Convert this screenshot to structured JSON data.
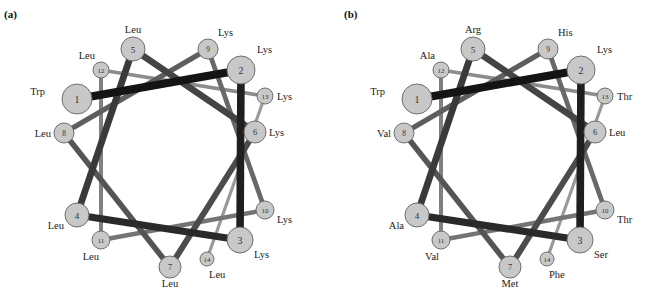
{
  "figure": {
    "type": "helical-wheel-diagram",
    "panels": [
      {
        "id": "a",
        "label": "(a)",
        "offset_x": 0,
        "residues": [
          "Trp",
          "Lys",
          "Lys",
          "Leu",
          "Leu",
          "Lys",
          "Leu",
          "Leu",
          "Lys",
          "Lys",
          "Leu",
          "Leu",
          "Lys",
          "Leu"
        ]
      },
      {
        "id": "b",
        "label": "(b)",
        "offset_x": 340,
        "residues": [
          "Trp",
          "Lys",
          "Ser",
          "Ala",
          "Arg",
          "Leu",
          "Met",
          "Val",
          "His",
          "Thr",
          "Val",
          "Ala",
          "Thr",
          "Phe"
        ]
      }
    ],
    "nodes": [
      {
        "n": 1,
        "x": 77,
        "y": 99,
        "r": 15,
        "label_dx": -32,
        "label_dy": -4,
        "anchor": "end"
      },
      {
        "n": 2,
        "x": 241,
        "y": 70,
        "r": 14,
        "label_dx": 16,
        "label_dy": -17,
        "anchor": "start"
      },
      {
        "n": 3,
        "x": 240,
        "y": 240,
        "r": 13,
        "label_dx": 14,
        "label_dy": 18,
        "anchor": "start"
      },
      {
        "n": 4,
        "x": 77,
        "y": 215,
        "r": 12,
        "label_dx": -13,
        "label_dy": 14,
        "anchor": "end"
      },
      {
        "n": 5,
        "x": 133,
        "y": 49,
        "r": 12,
        "label_dx": 0,
        "label_dy": -16,
        "anchor": "middle"
      },
      {
        "n": 6,
        "x": 255,
        "y": 132,
        "r": 11,
        "label_dx": 14,
        "label_dy": 4,
        "anchor": "start"
      },
      {
        "n": 7,
        "x": 170,
        "y": 267,
        "r": 11,
        "label_dx": 0,
        "label_dy": 20,
        "anchor": "middle"
      },
      {
        "n": 8,
        "x": 64,
        "y": 133,
        "r": 10,
        "label_dx": -13,
        "label_dy": 4,
        "anchor": "end"
      },
      {
        "n": 9,
        "x": 208,
        "y": 49,
        "r": 10,
        "label_dx": 10,
        "label_dy": -13,
        "anchor": "start"
      },
      {
        "n": 10,
        "x": 265,
        "y": 210,
        "r": 9,
        "label_dx": 12,
        "label_dy": 13,
        "anchor": "start"
      },
      {
        "n": 11,
        "x": 101,
        "y": 240,
        "r": 9,
        "label_dx": -2,
        "label_dy": 20,
        "anchor": "end"
      },
      {
        "n": 12,
        "x": 101,
        "y": 70,
        "r": 8,
        "label_dx": -6,
        "label_dy": -11,
        "anchor": "end"
      },
      {
        "n": 13,
        "x": 265,
        "y": 96,
        "r": 8,
        "label_dx": 12,
        "label_dy": 4,
        "anchor": "start"
      },
      {
        "n": 14,
        "x": 207,
        "y": 259,
        "r": 7,
        "label_dx": 2,
        "label_dy": 19,
        "anchor": "start"
      }
    ],
    "edge_colors": [
      "#141414",
      "#1f1f1f",
      "#2a2a2a",
      "#3a3a3a",
      "#444444",
      "#4c4c4c",
      "#555555",
      "#5e5e5e",
      "#686868",
      "#747474",
      "#808080",
      "#8c8c8c",
      "#9a9a9a"
    ],
    "edge_widths": [
      8,
      7.6,
      7.2,
      6.8,
      6.4,
      6,
      5.6,
      5.2,
      4.8,
      4.4,
      4,
      3.6,
      3.2
    ]
  }
}
